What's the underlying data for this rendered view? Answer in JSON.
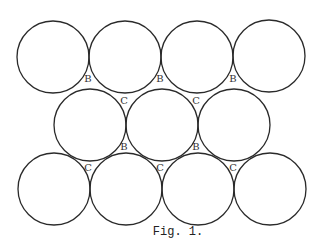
{
  "figure": {
    "caption": "Fig. 1.",
    "stroke_color": "#2a2a2a",
    "radius": 36,
    "circles": [
      {
        "row": 1,
        "cx": 53,
        "cy": 57
      },
      {
        "row": 1,
        "cx": 125,
        "cy": 57
      },
      {
        "row": 1,
        "cx": 197,
        "cy": 57
      },
      {
        "row": 1,
        "cx": 269,
        "cy": 56
      },
      {
        "row": 2,
        "cx": 90,
        "cy": 125
      },
      {
        "row": 2,
        "cx": 162,
        "cy": 125
      },
      {
        "row": 2,
        "cx": 234,
        "cy": 125
      },
      {
        "row": 3,
        "cx": 54,
        "cy": 189
      },
      {
        "row": 3,
        "cx": 126,
        "cy": 189
      },
      {
        "row": 3,
        "cx": 198,
        "cy": 189
      },
      {
        "row": 3,
        "cx": 270,
        "cy": 189
      }
    ],
    "labels": [
      {
        "text": "B",
        "x": 88,
        "y": 82
      },
      {
        "text": "B",
        "x": 160,
        "y": 82
      },
      {
        "text": "B",
        "x": 233,
        "y": 82
      },
      {
        "text": "C",
        "x": 124,
        "y": 104
      },
      {
        "text": "C",
        "x": 196,
        "y": 104
      },
      {
        "text": "B",
        "x": 124,
        "y": 150
      },
      {
        "text": "B",
        "x": 196,
        "y": 150
      },
      {
        "text": "C",
        "x": 88,
        "y": 171
      },
      {
        "text": "C",
        "x": 160,
        "y": 171
      },
      {
        "text": "C",
        "x": 233,
        "y": 171
      }
    ]
  }
}
